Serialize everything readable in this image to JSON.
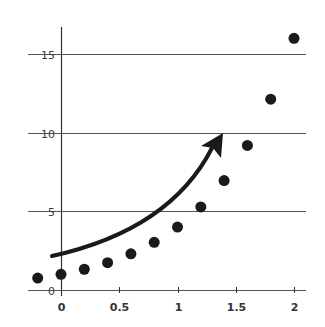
{
  "chart_data": {
    "type": "scatter",
    "title": "",
    "xlabel": "",
    "ylabel": "",
    "x": [
      -0.2,
      0,
      0.2,
      0.4,
      0.6,
      0.8,
      1.0,
      1.2,
      1.4,
      1.6,
      1.8,
      2.0
    ],
    "series": [
      {
        "name": "points",
        "values": [
          0.76,
          1.0,
          1.32,
          1.74,
          2.3,
          3.03,
          4.0,
          5.28,
          6.96,
          9.19,
          12.13,
          16.0
        ]
      }
    ],
    "xticks": [
      0,
      0.5,
      1,
      1.5,
      2
    ],
    "xtick_labels": [
      "0",
      "0.5",
      "1",
      "1.5",
      "2"
    ],
    "yticks": [
      0,
      5,
      10,
      15
    ],
    "ytick_labels": [
      "0",
      "5",
      "10",
      "15"
    ],
    "xlim": [
      -0.29,
      2.11
    ],
    "ylim": [
      -0.4,
      16.5
    ],
    "grid": "horizontal",
    "legend": null,
    "annotations": [
      {
        "type": "curved-arrow",
        "from": [
          -0.08,
          2.2
        ],
        "to": [
          1.4,
          10.0
        ],
        "meaning": "increasing trend"
      }
    ],
    "colors": {
      "points": "#1a1a1a",
      "grid": "#555555",
      "axis": "#333333",
      "arrow": "#1a1a1a"
    }
  }
}
